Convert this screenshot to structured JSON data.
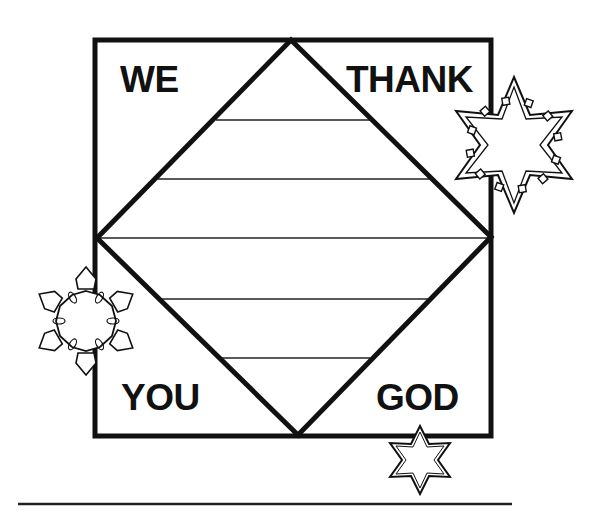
{
  "worksheet": {
    "words": {
      "top_left": "WE",
      "top_right": "THANK",
      "bottom_left": "YOU",
      "bottom_right": "GOD"
    },
    "writing_lines_count": 5,
    "decorations": [
      "snowflake-large",
      "snowflake-medium",
      "snowflake-small"
    ],
    "colors": {
      "ink": "#111111",
      "paper": "#ffffff"
    }
  }
}
